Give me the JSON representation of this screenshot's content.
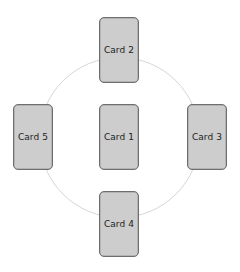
{
  "diagram": {
    "type": "radial card layout",
    "ring": {
      "cx": 119.5,
      "cy": 137.5,
      "r": 80,
      "stroke": "#d6d6d6"
    },
    "card_style": {
      "fill": "#cdcdcd",
      "border": "#6e6e6e",
      "text": "#222222"
    },
    "cards": [
      {
        "id": "card-1",
        "label": "Card 1",
        "position": "center",
        "x": 99,
        "y": 104
      },
      {
        "id": "card-2",
        "label": "Card 2",
        "position": "top",
        "x": 99,
        "y": 17
      },
      {
        "id": "card-3",
        "label": "Card 3",
        "position": "right",
        "x": 187,
        "y": 104
      },
      {
        "id": "card-4",
        "label": "Card 4",
        "position": "bottom",
        "x": 99,
        "y": 191
      },
      {
        "id": "card-5",
        "label": "Card 5",
        "position": "left",
        "x": 13,
        "y": 104
      }
    ]
  }
}
